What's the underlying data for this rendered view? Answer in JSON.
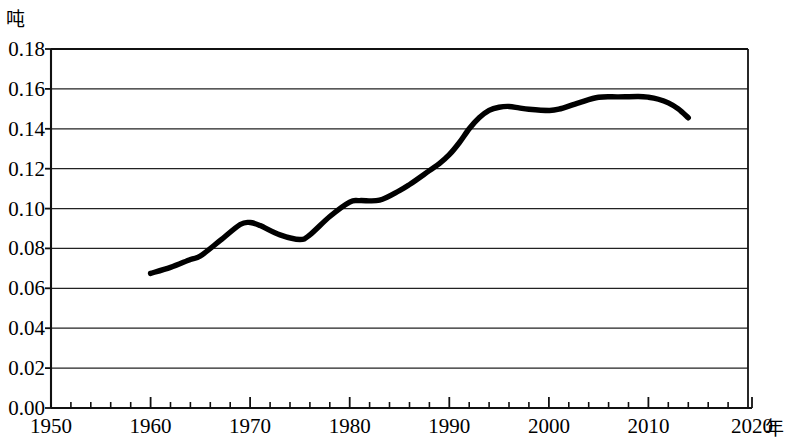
{
  "chart_data": {
    "type": "line",
    "title": "",
    "subtitle": "",
    "xlabel": "年",
    "ylabel": "吨",
    "ylabel_position": "top-left",
    "xlabel_position": "bottom-right",
    "grid": true,
    "grid_axis": "y",
    "legend": false,
    "legend_position": "none",
    "xlim": [
      1950,
      2020
    ],
    "ylim": [
      0.0,
      0.18
    ],
    "x_major_tick_step": 10,
    "x_minor_tick_step": 2,
    "y_tick_step": 0.02,
    "x_tick_labels": [
      "1950",
      "1960",
      "1970",
      "1980",
      "1990",
      "2000",
      "2010",
      "2020"
    ],
    "x_tick_values": [
      1950,
      1960,
      1970,
      1980,
      1990,
      2000,
      2010,
      2020
    ],
    "y_tick_labels": [
      "0.00",
      "0.02",
      "0.04",
      "0.06",
      "0.08",
      "0.10",
      "0.12",
      "0.14",
      "0.16",
      "0.18"
    ],
    "y_tick_values": [
      0.0,
      0.02,
      0.04,
      0.06,
      0.08,
      0.1,
      0.12,
      0.14,
      0.16,
      0.18
    ],
    "line_color": "#000000",
    "x": [
      1960,
      1962,
      1964,
      1965,
      1967,
      1969,
      1970,
      1971,
      1973,
      1975,
      1976,
      1978,
      1980,
      1981,
      1983,
      1985,
      1986,
      1988,
      1989,
      1990,
      1991,
      1992,
      1993,
      1994,
      1995,
      1996,
      1997,
      1998,
      2000,
      2001,
      2003,
      2005,
      2007,
      2009,
      2010,
      2011,
      2012,
      2013,
      2014
    ],
    "values": [
      0.0675,
      0.0705,
      0.0745,
      0.0762,
      0.084,
      0.092,
      0.093,
      0.0915,
      0.0868,
      0.0845,
      0.0868,
      0.096,
      0.1032,
      0.104,
      0.1042,
      0.109,
      0.112,
      0.119,
      0.1225,
      0.127,
      0.133,
      0.14,
      0.1455,
      0.1492,
      0.1508,
      0.1512,
      0.1505,
      0.1498,
      0.1492,
      0.1498,
      0.153,
      0.1558,
      0.156,
      0.1562,
      0.1558,
      0.1548,
      0.153,
      0.15,
      0.1455
    ],
    "series_name": "人均产量"
  },
  "chart_meta": {
    "y_axis_unit": "吨",
    "x_axis_unit": "年"
  }
}
